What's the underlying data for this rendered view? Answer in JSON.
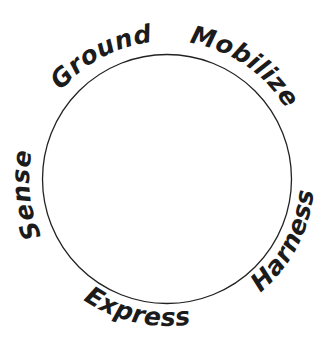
{
  "diagram": {
    "type": "cycle-diagram",
    "background_color": "#ffffff",
    "ink_color": "#1b1b1b",
    "shape": "circle",
    "labels": [
      {
        "text": "Ground",
        "position": "top-left"
      },
      {
        "text": "Mobilize",
        "position": "top-right"
      },
      {
        "text": "Sense",
        "position": "left"
      },
      {
        "text": "Harness",
        "position": "right"
      },
      {
        "text": "Express",
        "position": "bottom"
      }
    ]
  }
}
